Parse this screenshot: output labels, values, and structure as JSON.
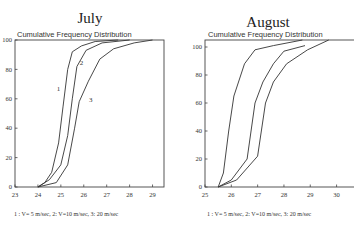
{
  "chart_data": [
    {
      "type": "line",
      "title": "July",
      "subtitle": "Cumulative Frequency Distribution",
      "xlabel": "",
      "ylabel": "",
      "xlim": [
        23,
        29.5
      ],
      "ylim": [
        0,
        100
      ],
      "xticks": [
        23,
        24,
        25,
        26,
        27,
        28,
        29
      ],
      "yticks": [
        0,
        20,
        40,
        60,
        80,
        100
      ],
      "grid": false,
      "legend_text": "1 : V= 5 m/sec, 2: V=10 m/sec, 3: 20 m/sec",
      "series": [
        {
          "name": "1",
          "label": "V=5 m/sec",
          "x": [
            24.0,
            24.3,
            24.6,
            24.9,
            25.1,
            25.3,
            25.5,
            25.9,
            26.5,
            27.5
          ],
          "y": [
            0,
            3,
            10,
            30,
            55,
            80,
            92,
            96,
            99,
            100
          ]
        },
        {
          "name": "2",
          "label": "V=10 m/sec",
          "x": [
            24.0,
            24.5,
            25.0,
            25.3,
            25.5,
            25.7,
            26.1,
            26.8,
            28.0
          ],
          "y": [
            0,
            5,
            15,
            35,
            60,
            82,
            93,
            98,
            100
          ]
        },
        {
          "name": "3",
          "label": "V=20 m/sec",
          "x": [
            24.0,
            24.8,
            25.3,
            25.6,
            25.8,
            26.2,
            26.7,
            27.3,
            28.2,
            29.0
          ],
          "y": [
            0,
            3,
            15,
            40,
            58,
            72,
            87,
            94,
            98,
            100
          ]
        }
      ],
      "annotations": [
        {
          "text": "1",
          "x": 24.9,
          "y": 65
        },
        {
          "text": "2",
          "x": 25.9,
          "y": 83
        },
        {
          "text": "3",
          "x": 26.3,
          "y": 58
        }
      ]
    },
    {
      "type": "line",
      "title": "August",
      "subtitle": "Cumulative Frequency Distribution",
      "xlabel": "",
      "ylabel": "",
      "xlim": [
        25,
        30.7
      ],
      "ylim": [
        0,
        105
      ],
      "xticks": [
        25,
        26,
        27,
        28,
        29,
        30
      ],
      "yticks": [
        0,
        20,
        40,
        60,
        80,
        100
      ],
      "grid": false,
      "legend_text": "1 : V= 5 m/sec, 2: V=10 m/sec, 3: 20 m/sec",
      "series": [
        {
          "name": "1",
          "label": "V=5 m/sec",
          "x": [
            25.5,
            25.7,
            25.9,
            26.1,
            26.5,
            26.9,
            27.6,
            28.7
          ],
          "y": [
            0,
            10,
            40,
            65,
            88,
            98,
            101,
            105
          ]
        },
        {
          "name": "2",
          "label": "V=10 m/sec",
          "x": [
            25.5,
            26.0,
            26.6,
            26.9,
            27.2,
            27.6,
            28.0,
            28.8
          ],
          "y": [
            0,
            5,
            20,
            60,
            75,
            88,
            97,
            101
          ]
        },
        {
          "name": "3",
          "label": "V=20 m/sec",
          "x": [
            25.5,
            26.2,
            27.0,
            27.3,
            27.6,
            28.1,
            28.9,
            29.7
          ],
          "y": [
            0,
            5,
            22,
            60,
            75,
            88,
            98,
            105
          ]
        }
      ],
      "annotations": []
    }
  ]
}
